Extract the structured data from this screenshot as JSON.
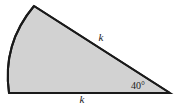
{
  "figure": {
    "name": "circular-sector-diagram",
    "background_color": "#ffffff",
    "fill_color": "#d2d2d2",
    "stroke_color": "#1a1a1a",
    "stroke_width": 2
  },
  "labels": {
    "side_upper": "k",
    "side_lower": "k",
    "angle": "40°"
  },
  "geometry": {
    "vertex_apex": {
      "x": 170,
      "y": 93
    },
    "vertex_top": {
      "x": 34,
      "y": 6
    },
    "vertex_bottom_left": {
      "x": 9,
      "y": 93
    },
    "arc_control": {
      "x": 2,
      "y": 44
    },
    "angle_degrees": 40,
    "label_positions": {
      "side_upper": {
        "x": 101,
        "y": 41
      },
      "side_lower": {
        "x": 82,
        "y": 103
      },
      "angle": {
        "x": 131,
        "y": 89
      }
    }
  }
}
